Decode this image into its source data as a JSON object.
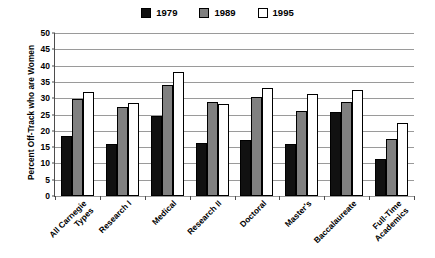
{
  "chart_data": {
    "type": "bar",
    "title": "",
    "subtitle": "",
    "xlabel": "",
    "ylabel": "Percent Off-Track who are Women",
    "ylim": [
      0,
      50
    ],
    "ytick_step": 5,
    "yticks": [
      0,
      5,
      10,
      15,
      20,
      25,
      30,
      35,
      40,
      45,
      50
    ],
    "ytick_labels": [
      "0",
      "5",
      "10",
      "15",
      "20",
      "25",
      "30",
      "35",
      "40",
      "45",
      "50"
    ],
    "grid": true,
    "grid_axis": "y",
    "legend_position": "top-center",
    "categories": [
      "All Carnegie\nTypes",
      "Research I",
      "Medical",
      "Research II",
      "Doctoral",
      "Master's",
      "Baccalaureate",
      "Full-Time\nAcademics"
    ],
    "series": [
      {
        "name": "1979",
        "color": "#111111",
        "values": [
          18.3,
          16.0,
          24.6,
          16.3,
          17.3,
          16.0,
          25.9,
          11.4
        ]
      },
      {
        "name": "1989",
        "color": "#808080",
        "values": [
          29.7,
          27.3,
          34.2,
          28.7,
          30.3,
          26.0,
          28.9,
          17.5
        ]
      },
      {
        "name": "1995",
        "color": "#ffffff",
        "values": [
          31.8,
          28.4,
          38.0,
          28.3,
          33.2,
          31.2,
          32.4,
          22.4
        ]
      }
    ]
  },
  "legend": {
    "entries": [
      {
        "label": "1979",
        "swatch_name": "legend-swatch-1979"
      },
      {
        "label": "1989",
        "swatch_name": "legend-swatch-1989"
      },
      {
        "label": "1995",
        "swatch_name": "legend-swatch-1995"
      }
    ]
  },
  "colors": {
    "series_1979": "#111111",
    "series_1989": "#808080",
    "series_1995": "#ffffff",
    "gridline": "#9a9a9a",
    "axis": "#4d4d4d",
    "background": "#ffffff",
    "text": "#000000"
  }
}
